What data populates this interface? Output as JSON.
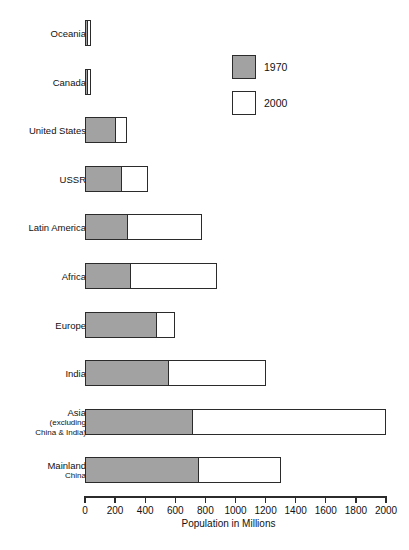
{
  "chart_data": {
    "type": "bar",
    "orientation": "horizontal",
    "title": "",
    "xlabel": "Population in Millions",
    "ylabel": "",
    "xlim": [
      0,
      2000
    ],
    "xticks": [
      0,
      200,
      400,
      600,
      800,
      1000,
      1200,
      1400,
      1600,
      1800,
      2000
    ],
    "xtick_labels": [
      "0",
      "200",
      "400",
      "600",
      "800",
      "1000",
      "1200",
      "1400",
      "1600",
      "1800",
      "2000"
    ],
    "grid": false,
    "legend_position": "upper right",
    "legend": [
      {
        "name": "1970",
        "color": "#a2a2a2"
      },
      {
        "name": "2000",
        "color": "#ffffff"
      }
    ],
    "categories": [
      "Oceania",
      "Canada",
      "United States",
      "USSR",
      "Latin America",
      "Africa",
      "Europe",
      "India",
      "Asia (excluding China & India)",
      "Mainland China"
    ],
    "series": [
      {
        "name": "1970",
        "color": "#a2a2a2",
        "values": [
          20,
          22,
          210,
          250,
          290,
          310,
          480,
          560,
          720,
          760
        ]
      },
      {
        "name": "2000",
        "color": "#ffffff",
        "values": [
          40,
          40,
          280,
          420,
          780,
          880,
          600,
          1200,
          2000,
          1300
        ]
      }
    ],
    "note": "Each category shows a gray 1970 segment followed by a white segment extending to the 2000 total."
  },
  "rows": [
    {
      "label": "Oceania",
      "sub": "",
      "v1970": 20,
      "v2000": 40
    },
    {
      "label": "Canada",
      "sub": "",
      "v1970": 22,
      "v2000": 40
    },
    {
      "label": "United States",
      "sub": "",
      "v1970": 210,
      "v2000": 280
    },
    {
      "label": "USSR",
      "sub": "",
      "v1970": 250,
      "v2000": 420
    },
    {
      "label": "Latin America",
      "sub": "",
      "v1970": 290,
      "v2000": 780
    },
    {
      "label": "Africa",
      "sub": "",
      "v1970": 310,
      "v2000": 880
    },
    {
      "label": "Europe",
      "sub": "",
      "v1970": 480,
      "v2000": 600
    },
    {
      "label": "India",
      "sub": "",
      "v1970": 560,
      "v2000": 1200
    },
    {
      "label": "Asia",
      "sub": "(excluding\nChina & India)",
      "v1970": 720,
      "v2000": 2000
    },
    {
      "label": "Mainland",
      "sub": "China",
      "v1970": 760,
      "v2000": 1300
    }
  ],
  "axis": {
    "title": "Population in Millions",
    "ticks": [
      "0",
      "200",
      "400",
      "600",
      "800",
      "1000",
      "1200",
      "1400",
      "1600",
      "1800",
      "2000"
    ]
  },
  "legend": {
    "items": [
      {
        "label": "1970"
      },
      {
        "label": "2000"
      }
    ]
  },
  "colors": {
    "series_1970": "#a2a2a2",
    "series_2000": "#ffffff",
    "outline": "#2b2b2b",
    "background": "#ffffff"
  }
}
